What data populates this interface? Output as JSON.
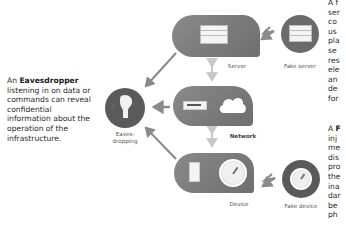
{
  "left_text": {
    "prefix": "An ",
    "term": "Eavesdropper",
    "body": "listening in on data or commands can reveal confidential information about the operation of the infrastructure."
  },
  "right_text_top": {
    "visible_fragments": [
      "A f",
      "ser",
      "co",
      "us",
      "pla",
      "se",
      "res",
      "ele",
      "an",
      "de",
      "for"
    ]
  },
  "right_text_bottom": {
    "visible_fragments": [
      "A F",
      "inj",
      "me",
      "dis",
      "pro",
      "the",
      "ina",
      "dar",
      "be",
      "ph"
    ]
  },
  "nodes": {
    "server": {
      "label": "Server",
      "icon": "server-rack-icon"
    },
    "fake_server": {
      "label": "Fake server",
      "icon": "server-rack-icon"
    },
    "network": {
      "label": "Network",
      "icons": [
        "router-icon",
        "cloud-icon"
      ]
    },
    "device": {
      "label": "Device",
      "icons": [
        "battery-icon",
        "gauge-icon"
      ]
    },
    "fake_device": {
      "label": "Fake device",
      "icon": "gauge-icon"
    },
    "eavesdropping": {
      "label": "Eaves-\ndropping",
      "icon": "ear-icon"
    }
  },
  "colors": {
    "node_fill": "#7d7d7d",
    "dark_circle": "#555555",
    "arrow": "#8a8a8a",
    "light_arrow": "#c8c8c8",
    "text": "#2a2a2a"
  }
}
